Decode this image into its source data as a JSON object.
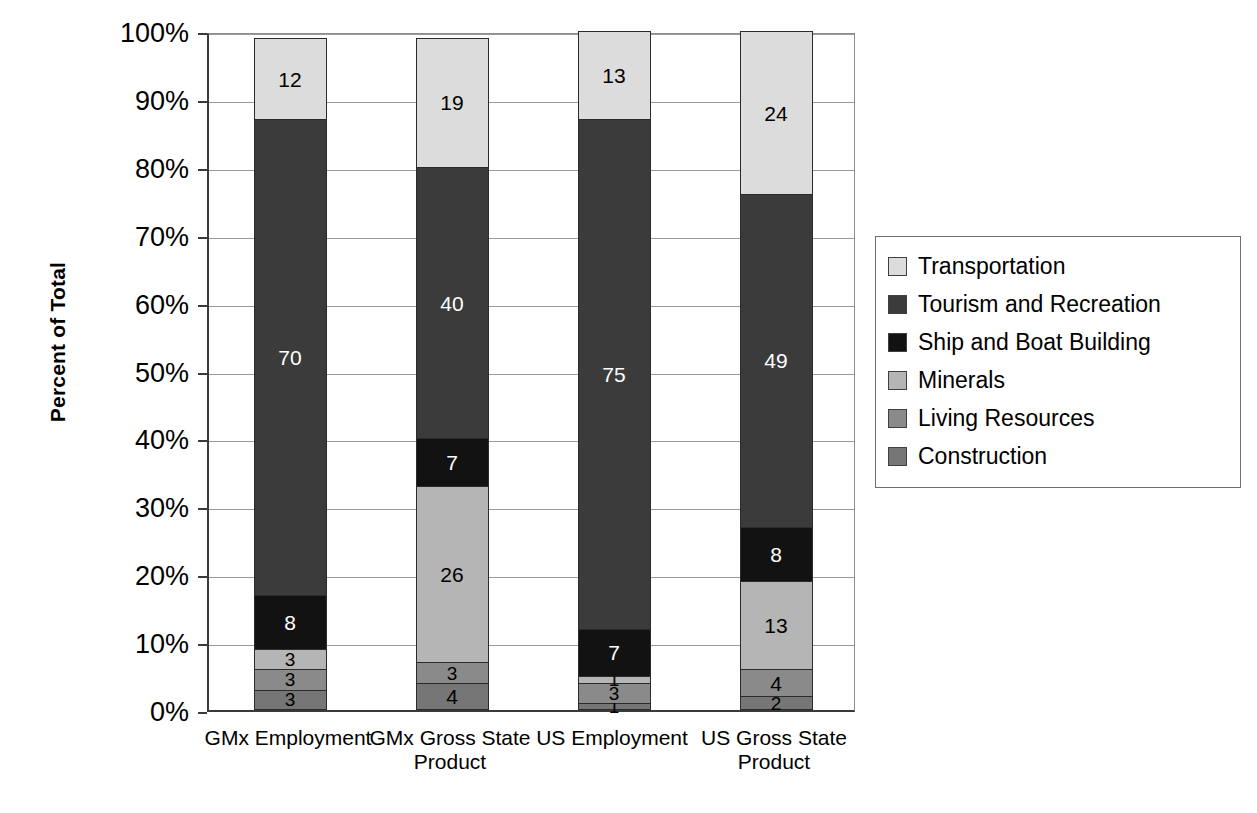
{
  "chart_data": {
    "type": "bar",
    "subtype": "stacked-100-percent",
    "title": "",
    "xlabel": "",
    "ylabel": "Percent of Total",
    "ylim": [
      0,
      100
    ],
    "ytick_labels": [
      "0%",
      "10%",
      "20%",
      "30%",
      "40%",
      "50%",
      "60%",
      "70%",
      "80%",
      "90%",
      "100%"
    ],
    "ytick_values": [
      0,
      10,
      20,
      30,
      40,
      50,
      60,
      70,
      80,
      90,
      100
    ],
    "grid": true,
    "legend_position": "right",
    "categories": [
      "GMx Employment",
      "GMx Gross State Product",
      "US Employment",
      "US Gross State Product"
    ],
    "series": [
      {
        "name": "Construction",
        "color": "#767676",
        "label_color": "#000000",
        "values": [
          3,
          4,
          1,
          2
        ]
      },
      {
        "name": "Living Resources",
        "color": "#8a8a8a",
        "label_color": "#000000",
        "values": [
          3,
          3,
          3,
          4
        ]
      },
      {
        "name": "Minerals",
        "color": "#b5b5b5",
        "label_color": "#000000",
        "values": [
          3,
          26,
          1,
          13
        ]
      },
      {
        "name": "Ship and Boat Building",
        "color": "#121212",
        "label_color": "#ffffff",
        "values": [
          8,
          7,
          7,
          8
        ]
      },
      {
        "name": "Tourism and Recreation",
        "color": "#3b3b3b",
        "label_color": "#ffffff",
        "values": [
          70,
          40,
          75,
          49
        ]
      },
      {
        "name": "Transportation",
        "color": "#dcdcdc",
        "label_color": "#000000",
        "values": [
          12,
          19,
          13,
          24
        ]
      }
    ],
    "legend_order": [
      "Transportation",
      "Tourism and Recreation",
      "Ship and Boat Building",
      "Minerals",
      "Living Resources",
      "Construction"
    ]
  }
}
